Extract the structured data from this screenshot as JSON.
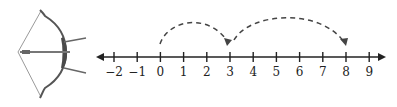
{
  "figure": {
    "number_line": {
      "min": -2,
      "max": 9,
      "ticks": [
        "−2",
        "−1",
        "0",
        "1",
        "2",
        "3",
        "4",
        "5",
        "6",
        "7",
        "8",
        "9"
      ],
      "both_ends_arrows": true
    },
    "jumps": [
      {
        "from": 0,
        "to": 3,
        "style": "dashed"
      },
      {
        "from": 3,
        "to": 8,
        "style": "dashed"
      }
    ],
    "colors": {
      "line": "#222222",
      "dash": "#444444",
      "bow": "#555555",
      "string": "#999999"
    }
  }
}
